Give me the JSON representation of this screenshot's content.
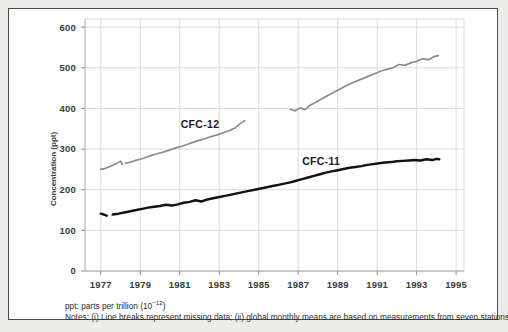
{
  "chart_data": {
    "type": "line",
    "title": "",
    "xlabel": "",
    "ylabel": "Concentration (ppt)",
    "xlim": [
      1976.2,
      1995.4
    ],
    "ylim": [
      0,
      620
    ],
    "xticks": [
      1977,
      1979,
      1981,
      1983,
      1985,
      1987,
      1989,
      1991,
      1993,
      1995
    ],
    "xtick_labels": [
      "1977",
      "1979",
      "1981",
      "1983",
      "1985",
      "1987",
      "1989",
      "1991",
      "1993",
      "1995"
    ],
    "yticks": [
      0,
      100,
      200,
      300,
      400,
      500,
      600
    ],
    "ytick_labels": [
      "0",
      "100",
      "200",
      "300",
      "400",
      "500",
      "600"
    ],
    "grid": true,
    "legend": "inline-annotations",
    "series": [
      {
        "name": "CFC-12",
        "color": "#8b8b8b",
        "label_x": 1981.05,
        "label_y": 352,
        "segments": [
          {
            "x": [
              1977.0,
              1977.2,
              1977.4,
              1977.55,
              1977.7,
              1977.85,
              1978.0,
              1978.1
            ],
            "y": [
              250,
              252,
              256,
              259,
              262,
              266,
              270,
              262
            ]
          },
          {
            "x": [
              1978.25,
              1978.5,
              1978.75,
              1979.0,
              1979.3,
              1979.6,
              1979.9,
              1980.2,
              1980.5,
              1980.8,
              1981.1,
              1981.4,
              1981.7,
              1982.0,
              1982.3,
              1982.6,
              1982.9,
              1983.2,
              1983.5,
              1983.8,
              1984.05,
              1984.3
            ],
            "y": [
              265,
              268,
              272,
              275,
              280,
              285,
              289,
              293,
              298,
              303,
              307,
              312,
              317,
              322,
              326,
              331,
              335,
              340,
              345,
              352,
              362,
              370
            ]
          },
          {
            "x": [
              1986.6,
              1986.85,
              1987.1,
              1987.35,
              1987.6,
              1987.9,
              1988.2,
              1988.5,
              1988.8,
              1989.1,
              1989.4,
              1989.7,
              1990.0,
              1990.3,
              1990.6,
              1990.9,
              1991.2,
              1991.5,
              1991.8,
              1992.1,
              1992.4,
              1992.7,
              1993.0,
              1993.3,
              1993.6,
              1993.9,
              1994.1
            ],
            "y": [
              398,
              394,
              401,
              397,
              408,
              415,
              424,
              432,
              440,
              447,
              455,
              462,
              468,
              474,
              480,
              486,
              492,
              496,
              500,
              508,
              506,
              512,
              516,
              522,
              520,
              528,
              530
            ]
          }
        ]
      },
      {
        "name": "CFC-11",
        "color": "#121212",
        "label_x": 1987.2,
        "label_y": 262,
        "segments": [
          {
            "x": [
              1977.0,
              1977.15,
              1977.3
            ],
            "y": [
              141,
              139,
              136
            ]
          },
          {
            "x": [
              1977.6,
              1977.9,
              1978.2,
              1978.5,
              1978.8,
              1979.1,
              1979.4,
              1979.7,
              1980.0,
              1980.3,
              1980.6,
              1980.9,
              1981.2,
              1981.5,
              1981.8,
              1982.1,
              1982.4,
              1982.7,
              1983.0,
              1983.3,
              1983.6,
              1983.9,
              1984.2,
              1984.5,
              1984.8,
              1985.1,
              1985.4,
              1985.7,
              1986.0,
              1986.3,
              1986.6,
              1986.9,
              1987.2,
              1987.5,
              1987.8,
              1988.1,
              1988.4,
              1988.7,
              1989.0,
              1989.3,
              1989.6,
              1989.9,
              1990.2,
              1990.5,
              1990.8,
              1991.1,
              1991.4,
              1991.7,
              1992.0,
              1992.3,
              1992.6,
              1992.9,
              1993.2,
              1993.5,
              1993.8,
              1994.0,
              1994.15
            ],
            "y": [
              139,
              141,
              144,
              147,
              150,
              153,
              156,
              158,
              160,
              163,
              161,
              164,
              168,
              170,
              174,
              171,
              176,
              179,
              182,
              185,
              188,
              191,
              194,
              197,
              200,
              203,
              206,
              209,
              212,
              215,
              218,
              222,
              226,
              230,
              234,
              238,
              242,
              245,
              248,
              251,
              254,
              256,
              258,
              261,
              263,
              265,
              267,
              268,
              270,
              271,
              272,
              273,
              272,
              275,
              273,
              276,
              275
            ]
          }
        ]
      }
    ]
  },
  "annotations": {
    "footnote_ppt_prefix": "ppt: parts per trillion (10",
    "footnote_ppt_exp": "−12",
    "footnote_ppt_suffix": ")",
    "footnote_notes": "Notes: (i) Line breaks represent missing data; (ii) global monthly means are based on measurements from seven stations worldwide"
  },
  "colors": {
    "cfc12": "#8b8b8b",
    "cfc11": "#121212",
    "grid": "#d2d2d2",
    "axis": "#9a9a9a",
    "frame": "#4a4a4a"
  }
}
